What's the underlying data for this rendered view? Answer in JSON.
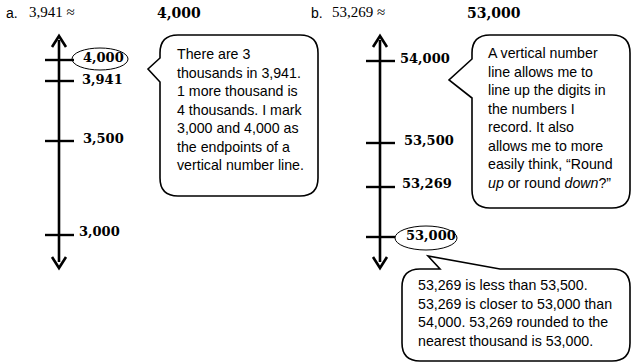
{
  "problem_a": {
    "label": "a.",
    "expression": "3,941 ≈",
    "answer": "4,000",
    "number_line": {
      "ticks": [
        {
          "value": "4,000",
          "circled": true
        },
        {
          "value": "3,941",
          "circled": false
        },
        {
          "value": "3,500",
          "circled": false
        },
        {
          "value": "3,000",
          "circled": false
        }
      ]
    },
    "bubble": {
      "lines": [
        "There are 3",
        "thousands in 3,941.",
        "1 more thousand is",
        "4 thousands.  I mark",
        "3,000 and 4,000 as",
        "the endpoints of a",
        "vertical number line."
      ]
    }
  },
  "problem_b": {
    "label": "b.",
    "expression": "53,269 ≈",
    "answer": "53,000",
    "number_line": {
      "ticks": [
        {
          "value": "54,000",
          "circled": false
        },
        {
          "value": "53,500",
          "circled": false
        },
        {
          "value": "53,269",
          "circled": false
        },
        {
          "value": "53,000",
          "circled": true
        }
      ]
    },
    "bubble_top": {
      "lines": [
        "A vertical number",
        "line allows me to",
        "line up the digits in",
        "the numbers I",
        "record.  It also",
        "allows me to more",
        "easily think, “Round"
      ],
      "last_line": {
        "em1": "up",
        "mid": " or round ",
        "em2": "down",
        "end": "?”"
      }
    },
    "bubble_bottom": {
      "lines": [
        "53,269 is less than 53,500.",
        "53,269 is closer to 53,000 than",
        "54,000.  53,269 rounded to the",
        "nearest thousand is 53,000."
      ]
    }
  }
}
